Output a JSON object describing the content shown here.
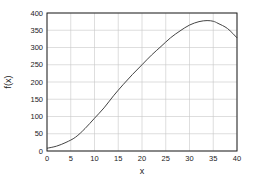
{
  "chart_data": {
    "type": "line",
    "title": "",
    "xlabel": "x",
    "ylabel": "f(x)",
    "xlim": [
      0,
      40
    ],
    "ylim": [
      0,
      400
    ],
    "grid": true,
    "legend": null,
    "x_ticks": [
      0,
      5,
      10,
      15,
      20,
      25,
      30,
      35,
      40
    ],
    "y_ticks": [
      0,
      50,
      100,
      150,
      200,
      250,
      300,
      350,
      400
    ],
    "series": [
      {
        "name": "f(x)",
        "color": "#444444",
        "x": [
          0,
          2,
          4,
          6,
          8,
          10,
          12,
          14,
          16,
          18,
          20,
          22,
          24,
          26,
          28,
          30,
          32,
          33.7,
          35,
          36,
          38,
          40
        ],
        "y": [
          8,
          14,
          25,
          40,
          65,
          95,
          125,
          160,
          192,
          222,
          250,
          278,
          303,
          328,
          348,
          365,
          375,
          378,
          376,
          370,
          355,
          328
        ]
      }
    ]
  }
}
